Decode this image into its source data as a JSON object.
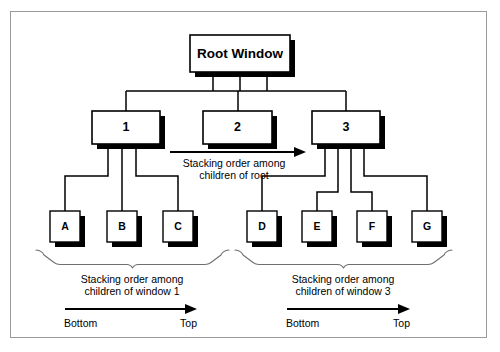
{
  "figure": {
    "border_color": "#9a9a9a",
    "background_color": "#ffffff",
    "ink_color": "#000000"
  },
  "nodes": {
    "root": {
      "label": "Root Window",
      "x": 190,
      "y": 35,
      "w": 100,
      "h": 37
    },
    "level1": [
      {
        "label": "1",
        "x": 92,
        "y": 111,
        "w": 68,
        "h": 33
      },
      {
        "label": "2",
        "x": 203,
        "y": 111,
        "w": 69,
        "h": 33
      },
      {
        "label": "3",
        "x": 312,
        "y": 111,
        "w": 68,
        "h": 33
      }
    ],
    "leaves": [
      {
        "label": "A",
        "x": 50,
        "y": 211,
        "w": 30,
        "h": 31,
        "parent": "1"
      },
      {
        "label": "B",
        "x": 107,
        "y": 211,
        "w": 30,
        "h": 31,
        "parent": "1"
      },
      {
        "label": "C",
        "x": 163,
        "y": 211,
        "w": 30,
        "h": 31,
        "parent": "1"
      },
      {
        "label": "D",
        "x": 247,
        "y": 211,
        "w": 30,
        "h": 31,
        "parent": "3"
      },
      {
        "label": "E",
        "x": 302,
        "y": 211,
        "w": 30,
        "h": 31,
        "parent": "3"
      },
      {
        "label": "F",
        "x": 357,
        "y": 211,
        "w": 30,
        "h": 31,
        "parent": "3"
      },
      {
        "label": "G",
        "x": 412,
        "y": 211,
        "w": 30,
        "h": 31,
        "parent": "3"
      }
    ]
  },
  "annotations": {
    "root_order": {
      "line1": "Stacking order among",
      "line2": "children of root"
    },
    "window1_order": {
      "line1": "Stacking order among",
      "line2": "children of window 1",
      "start_label": "Bottom",
      "end_label": "Top"
    },
    "window3_order": {
      "line1": "Stacking order among",
      "line2": "children of window 3",
      "start_label": "Bottom",
      "end_label": "Top"
    }
  }
}
